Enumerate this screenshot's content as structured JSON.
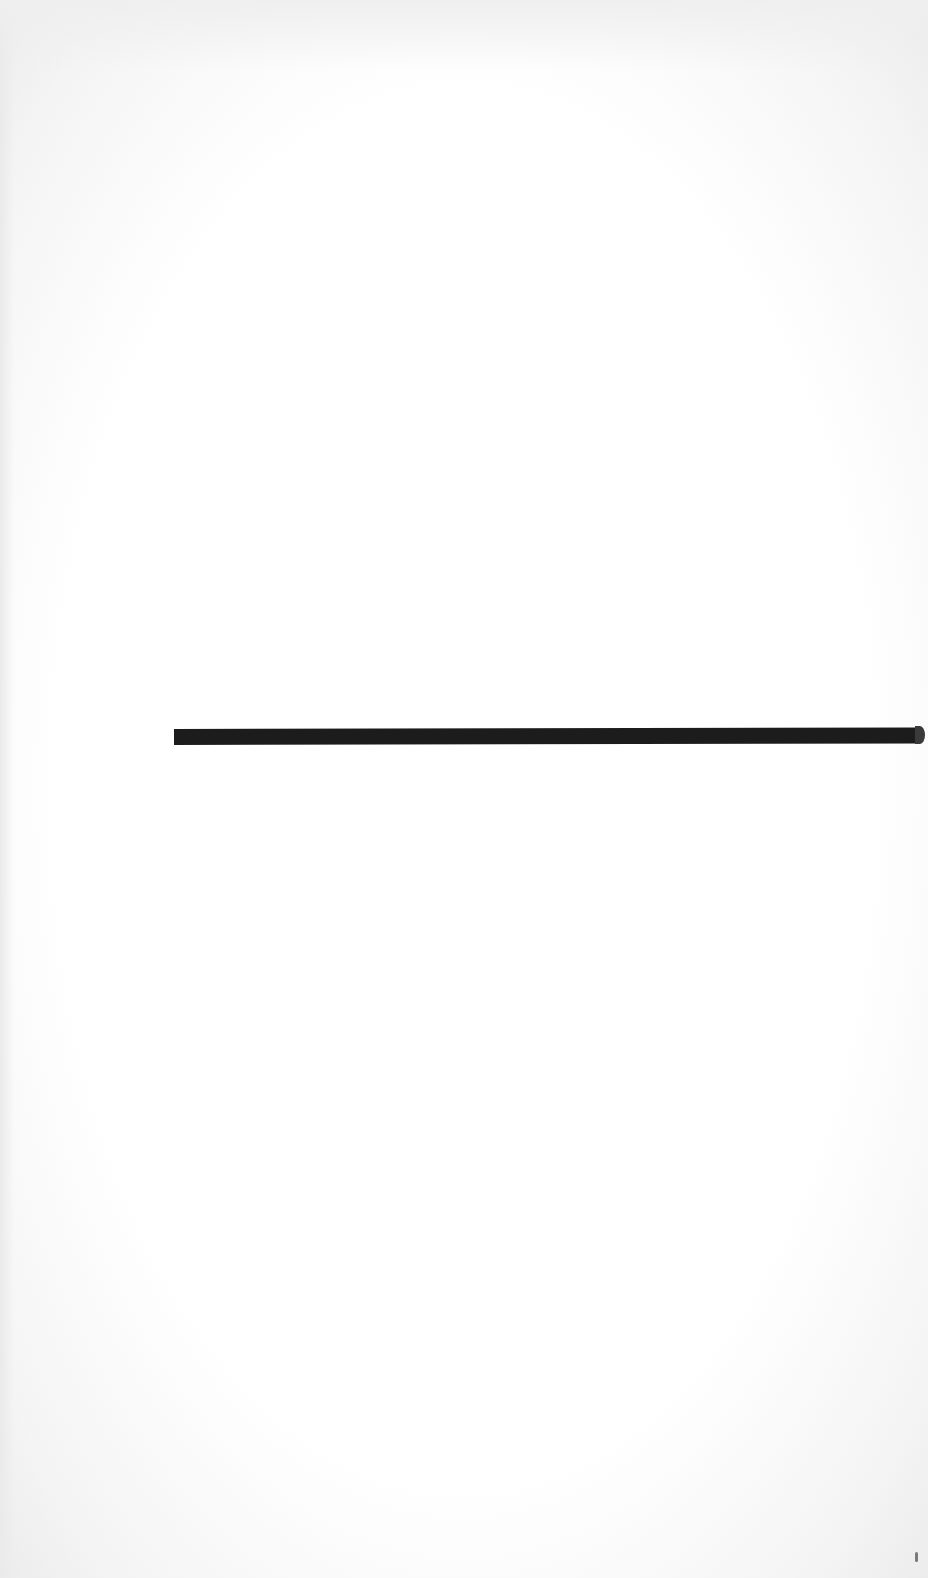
{
  "document": {
    "type": "scanned-page",
    "body_text": "",
    "elements": [
      {
        "kind": "horizontal-rule",
        "color": "#1c1c1c"
      }
    ],
    "background_color": "#ffffff"
  }
}
